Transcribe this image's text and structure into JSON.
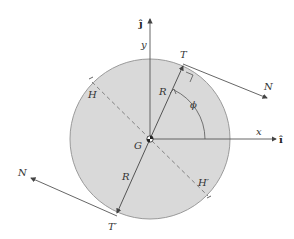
{
  "diagram": {
    "colors": {
      "disk_fill": "#d9d9d9",
      "disk_stroke": "#9a9a9a",
      "line": "#555555",
      "text": "#333333"
    },
    "labels": {
      "j_hat": "ĵ",
      "i_hat": "î",
      "y": "y",
      "x": "x",
      "T": "T",
      "T_prime": "T′",
      "N_top": "N",
      "N_bottom": "N",
      "R_top": "R",
      "R_bottom": "R",
      "phi": "ϕ",
      "G": "G",
      "H": "H",
      "H_prime": "H′"
    },
    "geometry": {
      "center": [
        150,
        139
      ],
      "radius": 80
    }
  }
}
